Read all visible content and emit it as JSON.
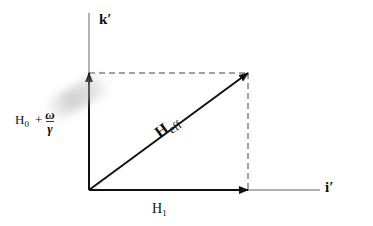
{
  "diagram": {
    "title": "",
    "axes": {
      "vertical": {
        "label": "k′"
      },
      "horizontal": {
        "label": "i′"
      }
    },
    "vectors": [
      {
        "name": "H1",
        "label_main": "H",
        "label_sub": "1",
        "direction": "along i′"
      },
      {
        "name": "H0_plus_omega_over_gamma",
        "label_main": "H",
        "label_sub": "0",
        "plus": "+",
        "frac_num": "ω",
        "frac_den": "γ",
        "direction": "along k′"
      },
      {
        "name": "Heff",
        "label_main": "H",
        "label_sub": "eff",
        "direction": "diagonal resultant"
      }
    ],
    "colors": {
      "line": "#111111",
      "axis_line": "#555555",
      "dashed": "#444444",
      "background": "#ffffff"
    }
  }
}
